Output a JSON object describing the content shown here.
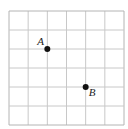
{
  "diagram": {
    "type": "coordinate-grid",
    "grid": {
      "columns": 6,
      "rows": 6,
      "line_color": "#c8c8c8",
      "border_color": "#b4b4b4"
    },
    "points": [
      {
        "label": "A",
        "col": 2,
        "row": 2,
        "label_position": "upper-left"
      },
      {
        "label": "B",
        "col": 4,
        "row": 4,
        "label_position": "lower-right"
      }
    ],
    "point_color": "#111111",
    "label_color": "#222222"
  }
}
